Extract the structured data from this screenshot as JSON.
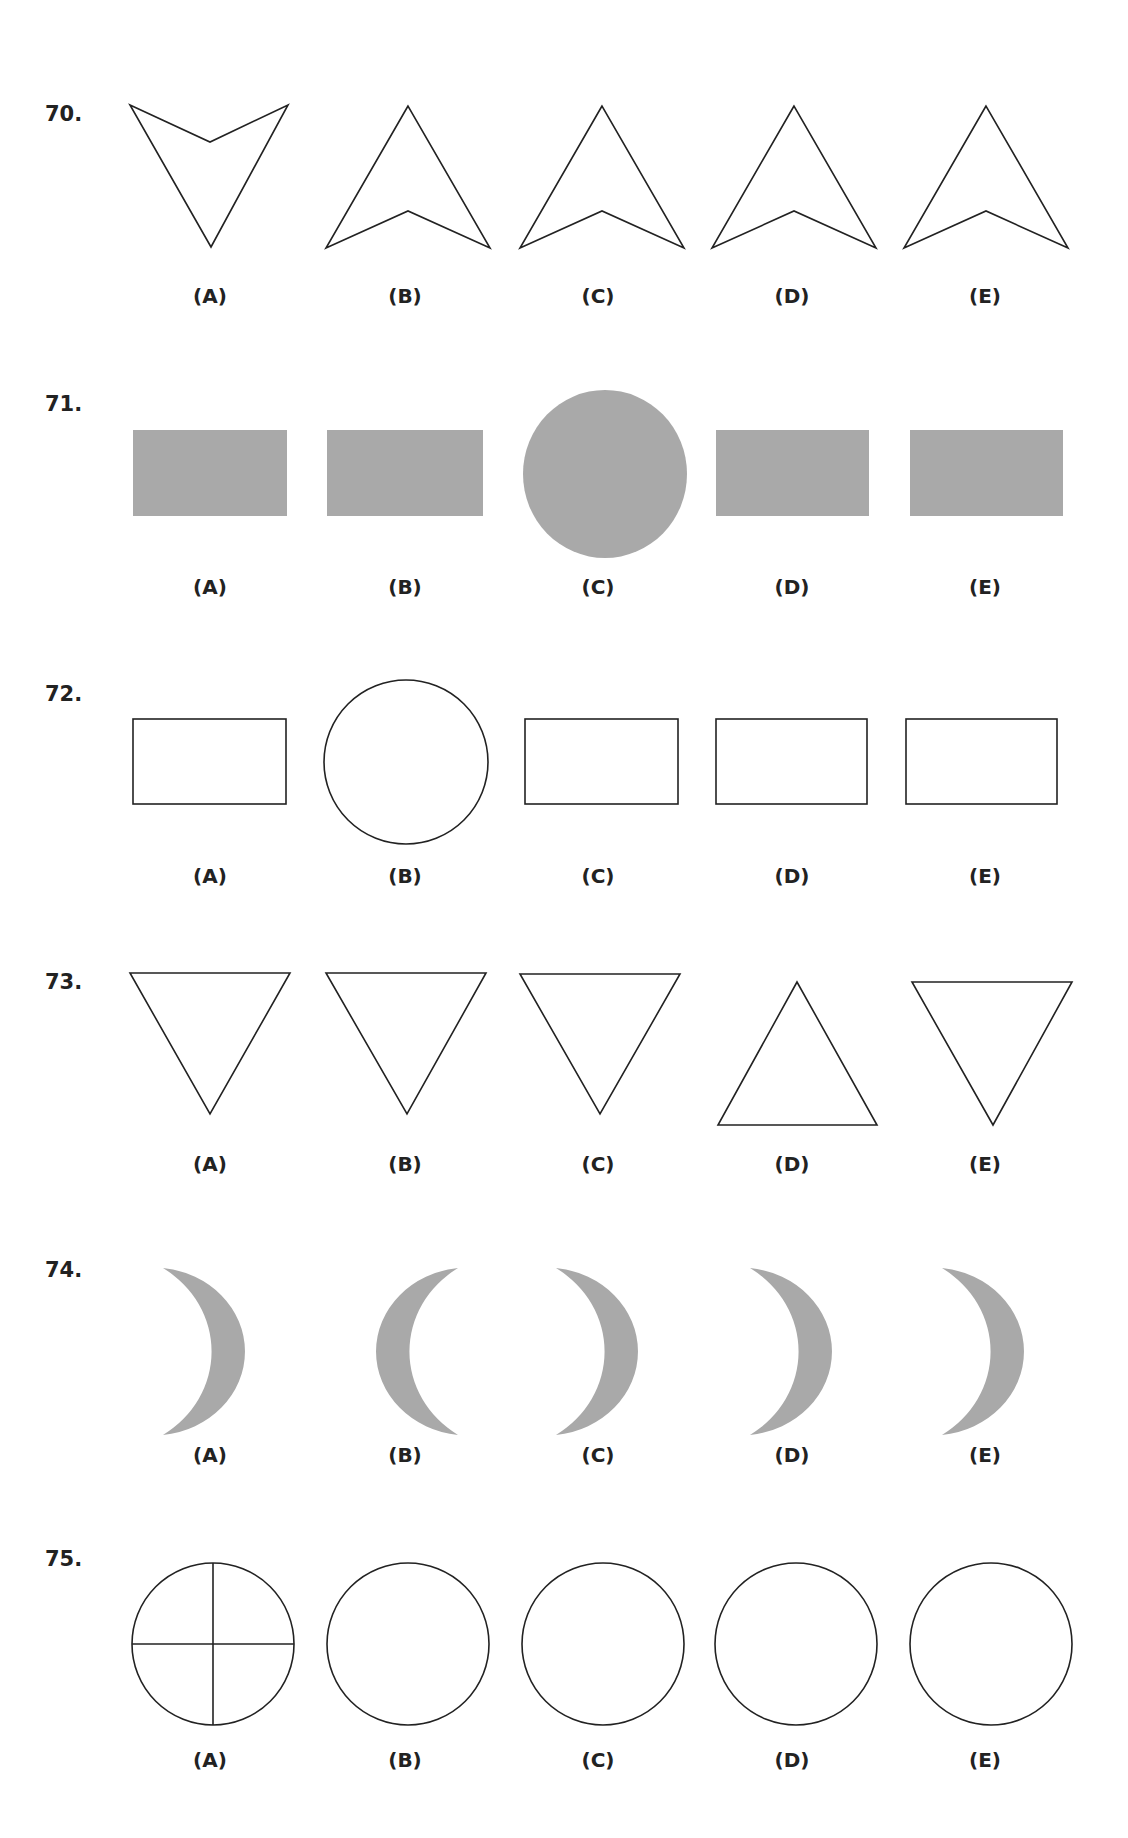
{
  "colors": {
    "outline": "#222222",
    "fill_gray": "#a9a9a9",
    "background": "#ffffff"
  },
  "questions": [
    {
      "number": "70.",
      "options": [
        {
          "label": "(A)",
          "shape": "arrowhead-pointing-down"
        },
        {
          "label": "(B)",
          "shape": "arrowhead-pointing-up"
        },
        {
          "label": "(C)",
          "shape": "arrowhead-pointing-up"
        },
        {
          "label": "(D)",
          "shape": "arrowhead-pointing-up"
        },
        {
          "label": "(E)",
          "shape": "arrowhead-pointing-up"
        }
      ]
    },
    {
      "number": "71.",
      "options": [
        {
          "label": "(A)",
          "shape": "gray-rectangle"
        },
        {
          "label": "(B)",
          "shape": "gray-rectangle"
        },
        {
          "label": "(C)",
          "shape": "gray-circle"
        },
        {
          "label": "(D)",
          "shape": "gray-rectangle"
        },
        {
          "label": "(E)",
          "shape": "gray-rectangle"
        }
      ]
    },
    {
      "number": "72.",
      "options": [
        {
          "label": "(A)",
          "shape": "outline-rectangle"
        },
        {
          "label": "(B)",
          "shape": "outline-circle"
        },
        {
          "label": "(C)",
          "shape": "outline-rectangle"
        },
        {
          "label": "(D)",
          "shape": "outline-rectangle"
        },
        {
          "label": "(E)",
          "shape": "outline-rectangle"
        }
      ]
    },
    {
      "number": "73.",
      "options": [
        {
          "label": "(A)",
          "shape": "triangle-pointing-down"
        },
        {
          "label": "(B)",
          "shape": "triangle-pointing-down"
        },
        {
          "label": "(C)",
          "shape": "triangle-pointing-down"
        },
        {
          "label": "(D)",
          "shape": "triangle-pointing-up"
        },
        {
          "label": "(E)",
          "shape": "triangle-pointing-down"
        }
      ]
    },
    {
      "number": "74.",
      "options": [
        {
          "label": "(A)",
          "shape": "crescent-opening-left"
        },
        {
          "label": "(B)",
          "shape": "crescent-opening-right"
        },
        {
          "label": "(C)",
          "shape": "crescent-opening-left"
        },
        {
          "label": "(D)",
          "shape": "crescent-opening-left"
        },
        {
          "label": "(E)",
          "shape": "crescent-opening-left"
        }
      ]
    },
    {
      "number": "75.",
      "options": [
        {
          "label": "(A)",
          "shape": "circle-with-cross"
        },
        {
          "label": "(B)",
          "shape": "outline-circle"
        },
        {
          "label": "(C)",
          "shape": "outline-circle"
        },
        {
          "label": "(D)",
          "shape": "outline-circle"
        },
        {
          "label": "(E)",
          "shape": "outline-circle"
        }
      ]
    }
  ]
}
